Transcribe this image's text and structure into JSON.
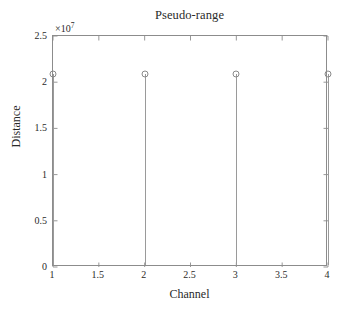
{
  "chart_data": {
    "type": "scatter",
    "plot_style": "stem",
    "title": "Pseudo-range",
    "xlabel": "Channel",
    "ylabel": "Distance",
    "y_exponent_label": "×10",
    "y_exponent_power": "7",
    "y_scale_factor": 10000000,
    "xlim": [
      1,
      4
    ],
    "ylim": [
      0,
      25000000
    ],
    "xticks": [
      1,
      1.5,
      2,
      2.5,
      3,
      3.5,
      4
    ],
    "xticklabels": [
      "1",
      "1.5",
      "2",
      "2.5",
      "3",
      "3.5",
      "4"
    ],
    "yticks": [
      0,
      5000000,
      10000000,
      15000000,
      20000000,
      25000000
    ],
    "yticklabels": [
      "0",
      "0.5",
      "1",
      "1.5",
      "2",
      "2.5"
    ],
    "grid": false,
    "legend": null,
    "series": [
      {
        "name": "Pseudo-range",
        "marker": "circle-open",
        "x": [
          1,
          2,
          3,
          4
        ],
        "values": [
          20700000,
          20700000,
          20650000,
          20700000
        ]
      }
    ],
    "colors": {
      "axis": "#8c8c8c",
      "stem": "#9a9a9a",
      "marker": "#8a8a8a",
      "text": "#2a2a2a",
      "background": "#ffffff"
    }
  }
}
